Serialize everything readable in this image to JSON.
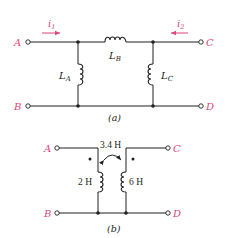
{
  "colors": {
    "wire": "#231f20",
    "terminal_label": "#d9467c",
    "current_arrow": "#e0457b",
    "background": "#ffffff"
  },
  "circuit_a": {
    "caption": "(a)",
    "terminals": {
      "A": "A",
      "B": "B",
      "C": "C",
      "D": "D"
    },
    "currents": [
      {
        "name": "i",
        "sub": "1",
        "direction": "right"
      },
      {
        "name": "i",
        "sub": "2",
        "direction": "left"
      }
    ],
    "inductors": [
      {
        "name": "L",
        "sub": "A",
        "position": "left shunt"
      },
      {
        "name": "L",
        "sub": "B",
        "position": "series top"
      },
      {
        "name": "L",
        "sub": "C",
        "position": "right shunt"
      }
    ]
  },
  "circuit_b": {
    "caption": "(b)",
    "terminals": {
      "A": "A",
      "B": "B",
      "C": "C",
      "D": "D"
    },
    "mutual_inductance": "3.4 H",
    "inductors": [
      {
        "value": "2 H",
        "position": "left",
        "dot": "top"
      },
      {
        "value": "6 H",
        "position": "right",
        "dot": "top"
      }
    ]
  }
}
